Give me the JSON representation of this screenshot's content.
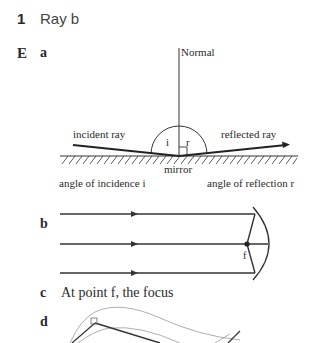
{
  "question1": {
    "number": "1",
    "answer": "Ray b"
  },
  "sectionE": {
    "label": "E",
    "parts": {
      "a": {
        "label": "a",
        "labels": {
          "normal": "Normal",
          "incident_ray": "incident ray",
          "reflected_ray": "reflected ray",
          "angle_i": "i",
          "angle_r": "r",
          "mirror": "mirror",
          "angle_incidence": "angle of incidence i",
          "angle_reflection": "angle of reflection r"
        }
      },
      "b": {
        "label": "b",
        "focus_label": "f"
      },
      "c": {
        "label": "c",
        "text": "At point f, the focus"
      },
      "d": {
        "label": "d"
      }
    }
  }
}
